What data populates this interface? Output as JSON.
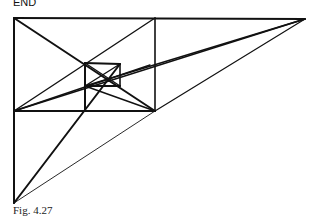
{
  "label_top": "END",
  "caption": "Fig. 4.27",
  "diagram": {
    "ink_color": "#111111"
  }
}
